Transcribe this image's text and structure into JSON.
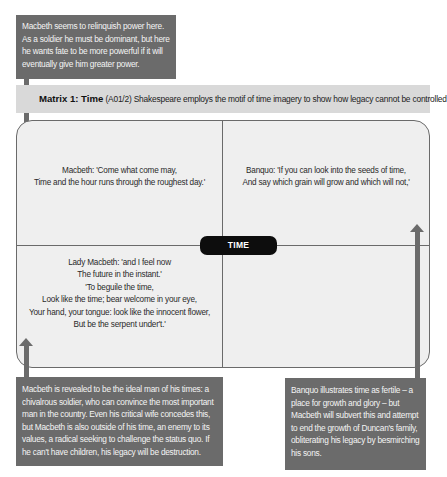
{
  "callouts": {
    "top": "Macbeth seems to relinquish power here. As a soldier he must be dominant, but here he wants fate to be more powerful if it will eventually give him greater power.",
    "bottom_left": "Macbeth is revealed to be the ideal man of his times: a chivalrous soldier, who can convince the most important man in the country. Even his critical wife concedes this, but Macbeth is also outside of his time, an enemy to its values, a radical seeking to challenge the status quo. If he can't have children, his legacy will be destruction.",
    "bottom_right": "Banquo illustrates time as fertile – a place for growth and glory – but Macbeth will subvert this and attempt to end the growth of Duncan's family, obliterating his legacy by besmirching his sons."
  },
  "header": {
    "title": "Matrix 1: Time",
    "code": "(A01/2)",
    "description": "Shakespeare employs the motif of time imagery to show how legacy cannot be controlled"
  },
  "matrix": {
    "center_label": "TIME",
    "quadrants": {
      "top_left": [
        "Macbeth: 'Come what come may,",
        "Time and the hour runs through the roughest day.'"
      ],
      "top_right": [
        "Banquo: 'If you can look into the seeds of time,",
        "And say which grain will grow and which will not,'"
      ],
      "bottom_left": [
        "Lady Macbeth: 'and I feel now",
        "The future in the instant.'",
        "'To beguile the time,",
        "Look like the time; bear welcome in your eye,",
        "Your hand, your tongue: look like the innocent flower,",
        "But be the serpent under't.'"
      ],
      "bottom_right": []
    }
  },
  "colors": {
    "callout_bg": "#6b6b6b",
    "header_bg": "#d9d9d9",
    "matrix_bg": "#efefef",
    "pill_bg": "#0d0d0d"
  }
}
